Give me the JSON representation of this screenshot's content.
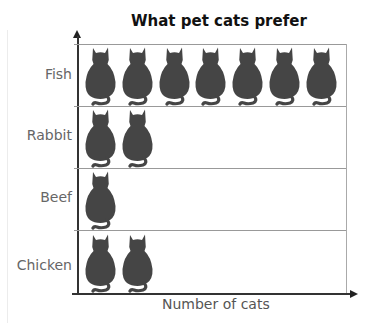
{
  "chart_data": {
    "type": "pictograph",
    "title": "What pet cats prefer",
    "xlabel": "Number of cats",
    "ylabel": "",
    "categories": [
      "Fish",
      "Rabbit",
      "Beef",
      "Chicken"
    ],
    "values": [
      7,
      2,
      1,
      2
    ],
    "icon": "cat-icon",
    "icon_unit": 1,
    "colors": {
      "icon": "#454545",
      "axis": "#333333",
      "grid": "#999999"
    },
    "grid": true,
    "legend": null
  },
  "labels": {
    "title": "What pet cats prefer",
    "xlabel": "Number of cats",
    "rows": [
      "Fish",
      "Rabbit",
      "Beef",
      "Chicken"
    ]
  }
}
